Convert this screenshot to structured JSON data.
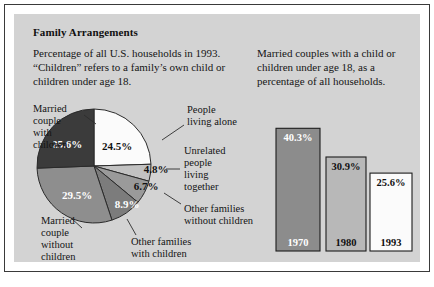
{
  "figure": {
    "title": "Family Arrangements",
    "intro": "Percentage of all U.S. households in 1993. “Children” refers to a family’s own child or children under age 18.",
    "bar_caption": "Married couples with a child or children under age 18, as a percentage of all households."
  },
  "colors": {
    "panel_background": "#d3d3d3",
    "frame_border": "#3a3a3a",
    "slice_white": "#fbfbfb",
    "slice_light_gray": "#c2c2c2",
    "slice_medium_gray": "#9a9a9a",
    "slice_mid_dark_gray": "#7c7c7c",
    "slice_gray": "#8e8e8e",
    "slice_dark": "#3b3b3b",
    "bar_1970": "#8c8c8c",
    "bar_1980": "#b8b8b8",
    "bar_1993": "#fbfbfb",
    "text_dark": "#101010",
    "text_light": "#ffffff"
  },
  "chart_data": [
    {
      "type": "pie",
      "title": "Family Arrangements",
      "units": "percent of all U.S. households, 1993",
      "start_angle_deg": 0,
      "direction": "clockwise",
      "categories": [
        "People living alone",
        "Unrelated people living together",
        "Other families without children",
        "Other families with children",
        "Married couple without children",
        "Married couple with children"
      ],
      "values": [
        24.5,
        4.8,
        6.7,
        8.9,
        29.5,
        25.6
      ],
      "value_labels": [
        "24.5%",
        "4.8%",
        "6.7%",
        "8.9%",
        "29.5%",
        "25.6%"
      ],
      "slice_colors": [
        "#fbfbfb",
        "#c2c2c2",
        "#9a9a9a",
        "#7c7c7c",
        "#8e8e8e",
        "#3b3b3b"
      ],
      "label_text_colors": [
        "dark",
        "dark",
        "dark",
        "light",
        "light",
        "light"
      ]
    },
    {
      "type": "bar",
      "title": "Married couples with a child or children under age 18, as a percentage of all households.",
      "categories": [
        "1970",
        "1980",
        "1993"
      ],
      "values": [
        40.3,
        30.9,
        25.6
      ],
      "value_labels": [
        "40.3%",
        "30.9%",
        "25.6%"
      ],
      "xlabel": "",
      "ylabel": "",
      "ylim": [
        0,
        46
      ],
      "grid": false,
      "legend": false,
      "bar_colors": [
        "#8c8c8c",
        "#b8b8b8",
        "#fbfbfb"
      ],
      "value_text_colors": [
        "light",
        "dark",
        "dark"
      ],
      "year_text_colors": [
        "light",
        "dark",
        "dark"
      ]
    }
  ]
}
